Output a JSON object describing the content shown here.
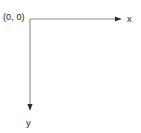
{
  "diagram": {
    "background_color": "#ffffff",
    "axis_color": "#8a8a8a",
    "arrow_color": "#2b2b2b",
    "text_color": "#1a1a1a",
    "origin": {
      "label": "(0, 0)",
      "x": 30,
      "y": 19
    },
    "x_axis": {
      "label": "x",
      "start_x": 30,
      "start_y": 19,
      "end_x": 122,
      "end_y": 19,
      "direction": "right"
    },
    "y_axis": {
      "label": "y",
      "start_x": 30,
      "start_y": 19,
      "end_x": 30,
      "end_y": 111,
      "direction": "down"
    }
  }
}
